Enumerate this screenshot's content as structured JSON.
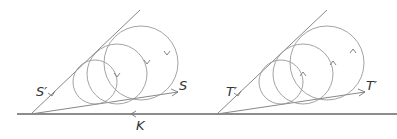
{
  "figure": {
    "left_panel": {
      "labels": {
        "upper_line": "S′",
        "lower_ray": "S",
        "base_line": "K"
      },
      "circle_count": 3
    },
    "right_panel": {
      "labels": {
        "upper_line": "T′",
        "lower_ray": "T′"
      },
      "circle_count": 3
    },
    "colors": {
      "stroke": "#888888",
      "base": "#666666",
      "text": "#333333"
    }
  }
}
